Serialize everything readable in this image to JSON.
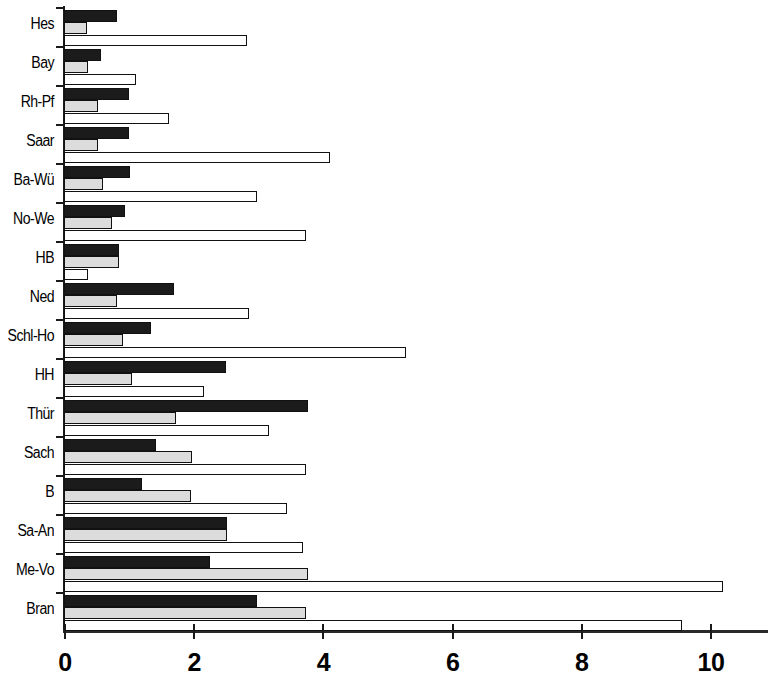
{
  "chart_data": {
    "type": "bar",
    "orientation": "horizontal",
    "title": "",
    "subtitle": "",
    "xlabel": "",
    "ylabel": "",
    "xlim": [
      0,
      11.2
    ],
    "xticks": [
      0,
      2,
      4,
      6,
      8,
      10
    ],
    "xtick_labels": [
      "0",
      "2",
      "4",
      "6",
      "8",
      "10"
    ],
    "grid": false,
    "legend": "none",
    "categories": [
      "Hes",
      "Bay",
      "Rh-Pf",
      "Saar",
      "Ba-Wü",
      "No-We",
      "HB",
      "Ned",
      "Schl-Ho",
      "HH",
      "Thür",
      "Sach",
      "B",
      "Sa-An",
      "Me-Vo",
      "Bran"
    ],
    "series": [
      {
        "name": "series-1",
        "color": "#1b1b1b",
        "values": [
          0.82,
          0.58,
          1.0,
          1.0,
          1.02,
          0.94,
          0.85,
          1.71,
          1.35,
          2.5,
          3.78,
          1.43,
          1.2,
          2.52,
          2.26,
          2.98
        ]
      },
      {
        "name": "series-2",
        "color": "#dcdcdc",
        "values": [
          0.35,
          0.37,
          0.52,
          0.52,
          0.6,
          0.75,
          0.85,
          0.82,
          0.92,
          1.06,
          1.74,
          1.98,
          1.97,
          2.52,
          3.77,
          3.75
        ]
      },
      {
        "name": "series-3",
        "color": "#ffffff",
        "values": [
          2.83,
          1.12,
          1.63,
          4.12,
          2.98,
          3.75,
          0.37,
          2.86,
          5.3,
          2.17,
          3.17,
          3.74,
          3.45,
          3.7,
          10.2,
          9.57
        ]
      }
    ]
  }
}
